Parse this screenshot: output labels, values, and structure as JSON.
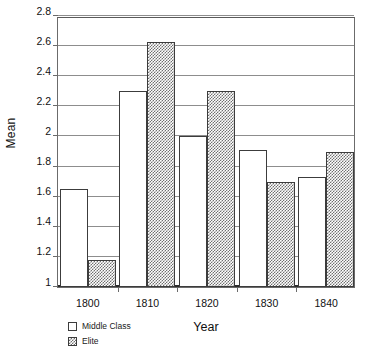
{
  "chart_data": {
    "type": "bar",
    "title": "",
    "xlabel": "Year",
    "ylabel": "Mean",
    "categories": [
      "1800",
      "1810",
      "1820",
      "1830",
      "1840"
    ],
    "series": [
      {
        "name": "Middle Class",
        "values": [
          1.65,
          2.3,
          2.0,
          1.91,
          1.73
        ]
      },
      {
        "name": "Elite",
        "values": [
          1.18,
          2.63,
          2.3,
          1.7,
          1.9
        ]
      }
    ],
    "ylim": [
      1,
      2.8
    ],
    "ytick_step": 0.2,
    "yticks": [
      "1",
      "1.2",
      "1.4",
      "1.6",
      "1.8",
      "2",
      "2.2",
      "2.4",
      "2.6",
      "2.8"
    ],
    "grid": "horizontal",
    "legend_position": "bottom-left",
    "legend": [
      {
        "label": "Middle Class",
        "swatch": "open-square"
      },
      {
        "label": "Elite",
        "swatch": "hatched-square"
      }
    ],
    "colors": {
      "middle_class": "#ffffff",
      "elite_hatch": "#707070",
      "axis": "#6b6b6b",
      "gridline": "#8d8d8d",
      "baseline": "#2b2b2b",
      "text": "#111111"
    }
  }
}
